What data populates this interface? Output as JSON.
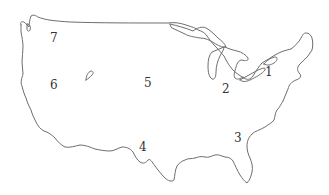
{
  "map": {
    "subject": "Outline map of the contiguous United States",
    "outline_color": "#6e6e6e",
    "label_color": "#333333",
    "regions": [
      {
        "id": "region-1",
        "label": "1",
        "x": 268,
        "y": 70
      },
      {
        "id": "region-2",
        "label": "2",
        "x": 222,
        "y": 84
      },
      {
        "id": "region-3",
        "label": "3",
        "x": 234,
        "y": 133
      },
      {
        "id": "region-4",
        "label": "4",
        "x": 139,
        "y": 141
      },
      {
        "id": "region-5",
        "label": "5",
        "x": 144,
        "y": 77
      },
      {
        "id": "region-6",
        "label": "6",
        "x": 51,
        "y": 80
      },
      {
        "id": "region-7",
        "label": "7",
        "x": 50,
        "y": 33
      }
    ]
  }
}
